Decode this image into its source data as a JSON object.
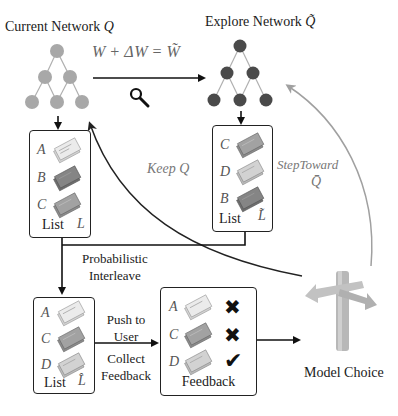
{
  "current_network": {
    "label": "Current Network",
    "symbol": "Q",
    "node_color": "#a8a8a8"
  },
  "explore_network": {
    "label": "Explore Network",
    "symbol": "Q̃",
    "node_color": "#4a4a4a"
  },
  "update_formula": {
    "lhs": "W",
    "plus": "+",
    "delta": "ΔW",
    "equals": "=",
    "rhs": "W̃"
  },
  "search_icon": "magnifier-icon",
  "list_L": {
    "label": "List",
    "symbol": "L",
    "items": [
      {
        "letter": "A",
        "shade": "light"
      },
      {
        "letter": "B",
        "shade": "dark"
      },
      {
        "letter": "C",
        "shade": "medium"
      }
    ]
  },
  "list_L_tilde": {
    "label": "List",
    "symbol": "L̃",
    "items": [
      {
        "letter": "C",
        "shade": "medium"
      },
      {
        "letter": "D",
        "shade": "light"
      },
      {
        "letter": "B",
        "shade": "dark"
      }
    ]
  },
  "keep_label": {
    "text": "Keep",
    "symbol": "Q"
  },
  "step_label": {
    "text": "StepToward",
    "symbol": "Q̄"
  },
  "interleave_label": {
    "line1": "Probabilistic",
    "line2": "Interleave"
  },
  "list_L_hat": {
    "label": "List",
    "symbol": "L̂",
    "items": [
      {
        "letter": "A",
        "shade": "light"
      },
      {
        "letter": "C",
        "shade": "medium"
      },
      {
        "letter": "D",
        "shade": "light"
      }
    ]
  },
  "push_label": {
    "line1": "Push to",
    "line2": "User"
  },
  "collect_label": {
    "line1": "Collect",
    "line2": "Feedback"
  },
  "feedback_box": {
    "label": "Feedback",
    "items": [
      {
        "letter": "A",
        "shade": "light",
        "mark": "✖",
        "result": "rejected"
      },
      {
        "letter": "C",
        "shade": "medium",
        "mark": "✖",
        "result": "rejected"
      },
      {
        "letter": "D",
        "shade": "light",
        "mark": "✔",
        "result": "accepted"
      }
    ]
  },
  "model_choice": {
    "label": "Model Choice"
  },
  "colors": {
    "light_doc": "#e2e2e2",
    "medium_doc": "#9c9c9c",
    "dark_doc": "#7e7e7e",
    "arrow": "#111111",
    "grey_arrow": "#a0a0a0"
  }
}
